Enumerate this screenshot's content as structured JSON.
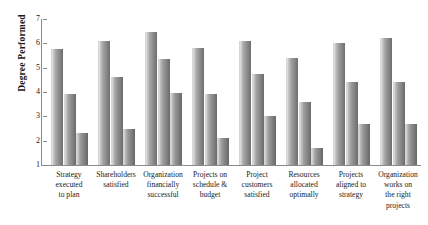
{
  "chart_data": {
    "type": "bar",
    "title": "",
    "subtitle": "",
    "xlabel": "",
    "ylabel": "Degree Performed",
    "ylim": [
      1,
      7
    ],
    "yticks": [
      1,
      2,
      3,
      4,
      5,
      6,
      7
    ],
    "grid": false,
    "legend_position": "none",
    "categories": [
      "Strategy executed to plan",
      "Shareholders satisfied",
      "Organization financially successful",
      "Projects on schedule & budget",
      "Project customers satisfied",
      "Resources allocated optimally",
      "Projects aligned to strategy",
      "Organization works on the right projects"
    ],
    "category_label_lines": [
      [
        "Strategy",
        "executed",
        "to plan"
      ],
      [
        "Shareholders",
        "satisfied"
      ],
      [
        "Organization",
        "financially",
        "successful"
      ],
      [
        "Projects on",
        "schedule &",
        "budget"
      ],
      [
        "Project",
        "customers",
        "satisfied"
      ],
      [
        "Resources",
        "allocated",
        "optimally"
      ],
      [
        "Projects",
        "aligned to",
        "strategy"
      ],
      [
        "Organization",
        "works on",
        "the right",
        "projects"
      ]
    ],
    "series": [
      {
        "name": "Series 1",
        "color": "#a6a6a6",
        "values": [
          5.75,
          6.1,
          6.45,
          5.8,
          6.1,
          5.4,
          6.0,
          6.2
        ]
      },
      {
        "name": "Series 2",
        "color": "#9e9e9e",
        "values": [
          3.9,
          4.6,
          5.35,
          3.9,
          4.75,
          3.6,
          4.4,
          4.4
        ]
      },
      {
        "name": "Series 3",
        "color": "#9a9a9a",
        "values": [
          2.3,
          2.5,
          3.95,
          2.1,
          3.0,
          1.7,
          2.7,
          2.7
        ]
      }
    ]
  },
  "axis": {
    "y_title": "Degree Performed",
    "y_tick_labels": [
      "7",
      "6",
      "5",
      "4",
      "3",
      "2",
      "1"
    ]
  }
}
